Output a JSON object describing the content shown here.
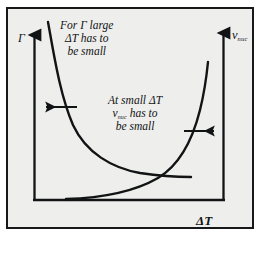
{
  "figure": {
    "type": "schematic-xy-diagram",
    "background_color": "#ffffff",
    "panel_color": "#eeeeec",
    "frame_color": "#16181a",
    "stroke_color": "#111315",
    "axes": {
      "x_label": "ΔT",
      "y_left_label": "Γ",
      "y_right_label_base": "v",
      "y_right_label_sub": "nuc"
    },
    "annotations": {
      "top_left": {
        "line1_prefix": "For ",
        "line1_symbol": "Γ",
        "line1_suffix": " large",
        "line2": "ΔT has to",
        "line3": "be small"
      },
      "middle": {
        "line1": "At small ΔT",
        "line2_base": "v",
        "line2_sub": "nuc",
        "line2_suffix": " has to",
        "line3": "be small"
      }
    },
    "curves": [
      {
        "name": "gamma-decaying-curve",
        "description": "steeply decaying hyperbola-like curve from upper left to flat right",
        "direction": "decreasing"
      },
      {
        "name": "vnuc-rising-curve",
        "description": "slowly rising then steeply increasing exponential-like curve",
        "direction": "increasing"
      }
    ],
    "arrows": [
      {
        "name": "left-arrow",
        "points_to": "left",
        "associated_axis": "y_left"
      },
      {
        "name": "right-arrow",
        "points_to": "right",
        "associated_axis": "y_right"
      },
      {
        "name": "y-left-axis-arrow",
        "points_to": "up",
        "associated_axis": "y_left"
      },
      {
        "name": "y-right-axis-arrow",
        "points_to": "up",
        "associated_axis": "y_right"
      }
    ]
  }
}
